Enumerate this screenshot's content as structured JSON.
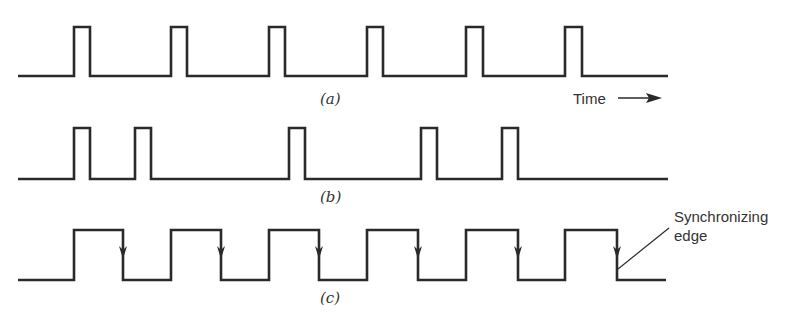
{
  "figure": {
    "waveforms": [
      {
        "id": "a",
        "caption": "(a)",
        "description": "Periodic narrow pulses",
        "pulses": [
          [
            74,
            90
          ],
          [
            171,
            187
          ],
          [
            269,
            285
          ],
          [
            367,
            383
          ],
          [
            466,
            483
          ],
          [
            565,
            582
          ]
        ]
      },
      {
        "id": "b",
        "caption": "(b)",
        "description": "Irregular narrow pulses",
        "pulses": [
          [
            74,
            90
          ],
          [
            135,
            151
          ],
          [
            289,
            305
          ],
          [
            421,
            437
          ],
          [
            502,
            518
          ]
        ]
      },
      {
        "id": "c",
        "caption": "(c)",
        "description": "Square wave with marked synchronizing (falling) edges",
        "pulses": [
          [
            74,
            123
          ],
          [
            171,
            221
          ],
          [
            269,
            319
          ],
          [
            367,
            418
          ],
          [
            466,
            518
          ],
          [
            565,
            617
          ]
        ],
        "edge_marker": "down-arrow"
      }
    ],
    "time_label": "Time",
    "annotation": {
      "line1": "Synchronizing",
      "line2": "edge"
    }
  }
}
